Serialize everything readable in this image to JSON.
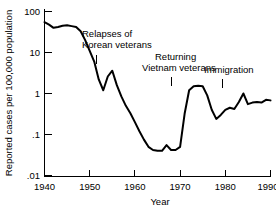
{
  "chart_data": {
    "type": "line",
    "title": "",
    "xlabel": "Year",
    "ylabel": "Reported cases per 100,000 population",
    "xlim": [
      1940,
      1990
    ],
    "ylim": [
      0.01,
      100
    ],
    "yscale": "log",
    "grid": false,
    "legend": "none",
    "xticks": [
      1940,
      1950,
      1960,
      1970,
      1980,
      1990
    ],
    "xticklabels": [
      "1940",
      "1950",
      "1960",
      "1970",
      "1980",
      "1990"
    ],
    "yticks": [
      100,
      10,
      1,
      0.1,
      0.01
    ],
    "yticklabels": [
      "100",
      "10",
      "1",
      ".1",
      ".01"
    ],
    "series": [
      {
        "name": "Reported cases",
        "x": [
          1940,
          1941,
          1942,
          1943,
          1944,
          1945,
          1946,
          1947,
          1948,
          1949,
          1950,
          1951,
          1952,
          1953,
          1954,
          1955,
          1956,
          1957,
          1958,
          1959,
          1960,
          1961,
          1962,
          1963,
          1964,
          1965,
          1966,
          1967,
          1968,
          1969,
          1970,
          1971,
          1972,
          1973,
          1974,
          1975,
          1976,
          1977,
          1978,
          1979,
          1980,
          1981,
          1982,
          1983,
          1984,
          1985,
          1986,
          1987,
          1988,
          1989,
          1990
        ],
        "y": [
          55,
          48,
          40,
          42,
          45,
          46,
          44,
          42,
          33,
          20,
          11,
          6,
          2.2,
          1.2,
          2.6,
          3.6,
          1.6,
          0.85,
          0.5,
          0.33,
          0.2,
          0.12,
          0.075,
          0.05,
          0.042,
          0.04,
          0.04,
          0.055,
          0.042,
          0.042,
          0.05,
          0.32,
          1.2,
          1.5,
          1.55,
          1.5,
          0.9,
          0.4,
          0.24,
          0.3,
          0.4,
          0.45,
          0.42,
          0.62,
          1.0,
          0.55,
          0.6,
          0.62,
          0.6,
          0.7,
          0.68
        ]
      }
    ],
    "annotations": [
      {
        "id": "korean-veterans",
        "lines": [
          "Relapses of",
          "Korean veterans"
        ],
        "pointer_year": 1953,
        "pointer_value": 3.0
      },
      {
        "id": "vietnam-veterans",
        "lines": [
          "Returning",
          "Vietnam veterans"
        ],
        "pointer_year": 1972,
        "pointer_value": 3.0
      },
      {
        "id": "immigration",
        "lines": [
          "Immigration"
        ],
        "pointer_year": 1984,
        "pointer_value": 2.2
      }
    ]
  },
  "labels": {
    "ytick_100": "100",
    "ytick_10": "10",
    "ytick_1": "1",
    "ytick_01": ".1",
    "ytick_001": ".01",
    "xtick_1940": "1940",
    "xtick_1950": "1950",
    "xtick_1960": "1960",
    "xtick_1970": "1970",
    "xtick_1980": "1980",
    "xtick_1990": "1990",
    "xaxis_title": "Year",
    "yaxis_title": "Reported cases per 100,000 population",
    "annot_korean_line1": "Relapses of",
    "annot_korean_line2": "Korean veterans",
    "annot_vietnam_line1": "Returning",
    "annot_vietnam_line2": "Vietnam veterans",
    "annot_immigration_line1": "Immigration"
  }
}
